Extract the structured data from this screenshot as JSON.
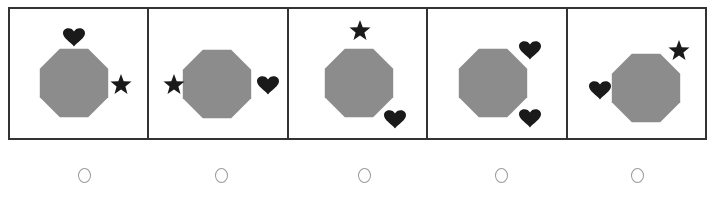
{
  "question": {
    "type": "odd-one-out",
    "colors": {
      "octagon": "#8c8c8c",
      "symbol": "#1a1a1a",
      "border": "#333333",
      "radio": "#999999"
    },
    "options": [
      {
        "index": 1,
        "shapes": [
          {
            "type": "octagon",
            "cx": 64,
            "cy": 74
          },
          {
            "type": "heart",
            "x": 64,
            "y": 27
          },
          {
            "type": "star",
            "x": 111,
            "y": 76
          }
        ],
        "selected": false
      },
      {
        "index": 2,
        "shapes": [
          {
            "type": "octagon",
            "cx": 68,
            "cy": 75
          },
          {
            "type": "star",
            "x": 25,
            "y": 76
          },
          {
            "type": "heart",
            "x": 119,
            "y": 75
          }
        ],
        "selected": false
      },
      {
        "index": 3,
        "shapes": [
          {
            "type": "octagon",
            "cx": 70,
            "cy": 74
          },
          {
            "type": "star",
            "x": 71,
            "y": 22
          },
          {
            "type": "heart",
            "x": 106,
            "y": 109
          }
        ],
        "selected": false
      },
      {
        "index": 4,
        "shapes": [
          {
            "type": "octagon",
            "cx": 65,
            "cy": 74
          },
          {
            "type": "heart",
            "x": 102,
            "y": 40
          },
          {
            "type": "heart",
            "x": 102,
            "y": 108
          }
        ],
        "selected": false
      },
      {
        "index": 5,
        "shapes": [
          {
            "type": "octagon",
            "cx": 78,
            "cy": 79
          },
          {
            "type": "heart",
            "x": 32,
            "y": 80
          },
          {
            "type": "star",
            "x": 111,
            "y": 42
          }
        ],
        "selected": false
      }
    ]
  }
}
